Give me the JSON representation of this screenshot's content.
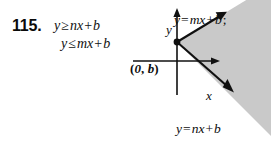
{
  "exercise": {
    "number": "115.",
    "inequalities": [
      {
        "lhs": "y",
        "relation": "≥",
        "term": "nx",
        "op": "+",
        "constant": "b"
      },
      {
        "lhs": "y",
        "relation": "≤",
        "term": "mx",
        "op": "+",
        "constant": "b"
      }
    ]
  },
  "diagram": {
    "axes": {
      "y_label": "y",
      "x_label": "x"
    },
    "vertex": {
      "label_open": "(",
      "label_x": "0",
      "label_comma": ", ",
      "label_y": "b",
      "label_close": ")"
    },
    "line_labels": {
      "upper": {
        "lhs": "y",
        "eq": "=",
        "term": "mx",
        "op": "+",
        "constant": "b",
        "punct": ";"
      },
      "lower": {
        "lhs": "y",
        "eq": "=",
        "term": "nx",
        "op": "+",
        "constant": "b",
        "punct": ""
      }
    },
    "colors": {
      "shade": "#c9c9c9",
      "ink": "#101010",
      "background": "#ffffff"
    }
  }
}
